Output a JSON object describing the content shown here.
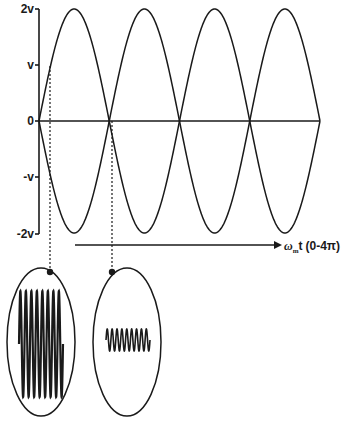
{
  "diagram": {
    "y_axis": {
      "ticks": [
        {
          "label": "2v",
          "value": 2
        },
        {
          "label": "v",
          "value": 1
        },
        {
          "label": "0",
          "value": 0
        },
        {
          "label": "-v",
          "value": -1
        },
        {
          "label": "-2v",
          "value": -2
        }
      ]
    },
    "x_axis": {
      "symbol": "ω",
      "subscript": "m",
      "var": "t",
      "range_label": "(0-4π)"
    },
    "curves": {
      "description": "Envelope ±2v·sin(ωm t) over 0 to 4π (four half-lobes, mirrored about zero)",
      "half_cycles": 4,
      "amplitude_label": "2v"
    },
    "insets": [
      {
        "name": "inset-at-v",
        "description": "High-amplitude dense oscillation sampled where envelope = v",
        "cycles": 8
      },
      {
        "name": "inset-at-zero",
        "description": "Low-amplitude oscillation sampled at envelope zero crossing",
        "cycles": 9
      }
    ],
    "colors": {
      "stroke": "#1a1a1a",
      "background": "#ffffff"
    }
  }
}
